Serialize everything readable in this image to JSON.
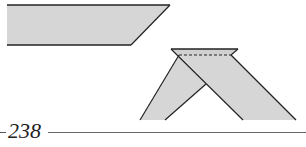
{
  "figure": {
    "fill_color": "#d6d6d6",
    "stroke_color": "#222222",
    "shapes": [
      {
        "name": "paper-strip-unfolded",
        "type": "parallelogram"
      },
      {
        "name": "paper-strip-folded",
        "type": "folded-strip",
        "fold_line": "dashed"
      }
    ]
  },
  "footer": {
    "page_number": "238"
  }
}
